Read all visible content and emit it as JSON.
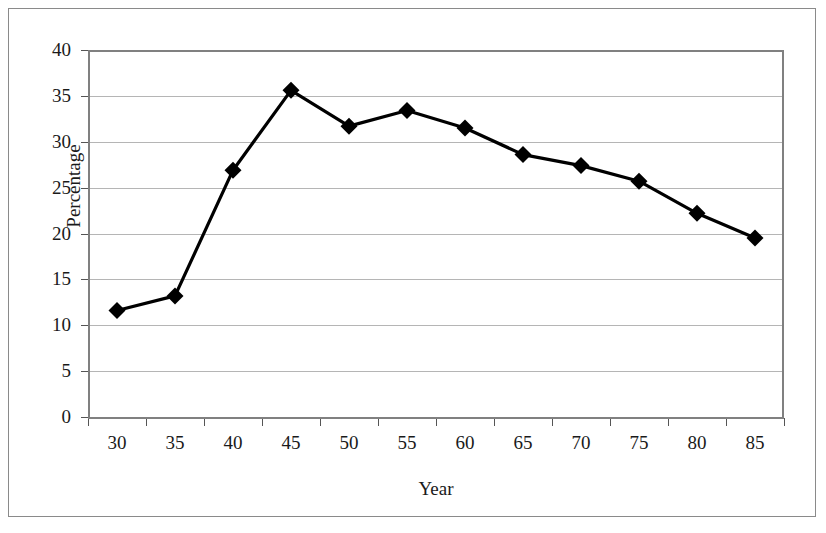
{
  "chart_data": {
    "type": "line",
    "title": "",
    "xlabel": "Year",
    "ylabel": "Percentage",
    "categories": [
      "30",
      "35",
      "40",
      "45",
      "50",
      "55",
      "60",
      "65",
      "70",
      "75",
      "80",
      "85"
    ],
    "values": [
      11.6,
      13.2,
      26.9,
      35.6,
      31.7,
      33.4,
      31.5,
      28.6,
      27.4,
      25.7,
      22.2,
      19.5
    ],
    "series": [
      {
        "name": "Percentage",
        "values": [
          11.6,
          13.2,
          26.9,
          35.6,
          31.7,
          33.4,
          31.5,
          28.6,
          27.4,
          25.7,
          22.2,
          19.5
        ],
        "color": "#000000",
        "marker": "diamond"
      }
    ],
    "ylim": [
      0,
      40
    ],
    "yticks": [
      0,
      5,
      10,
      15,
      20,
      25,
      30,
      35,
      40
    ],
    "ytick_labels": [
      "0",
      "5",
      "10",
      "15",
      "20",
      "25",
      "30",
      "35",
      "40"
    ],
    "xtick_labels": [
      "30",
      "35",
      "40",
      "45",
      "50",
      "55",
      "60",
      "65",
      "70",
      "75",
      "80",
      "85"
    ],
    "grid": true,
    "grid_axis": "y",
    "legend": false,
    "legend_position": "none",
    "plot_border": true,
    "frame_color": "#8a8a8a",
    "gridline_color": "#b5b5b5",
    "line_color": "#000000",
    "text_color": "#1a1a1a",
    "background": "#ffffff"
  }
}
